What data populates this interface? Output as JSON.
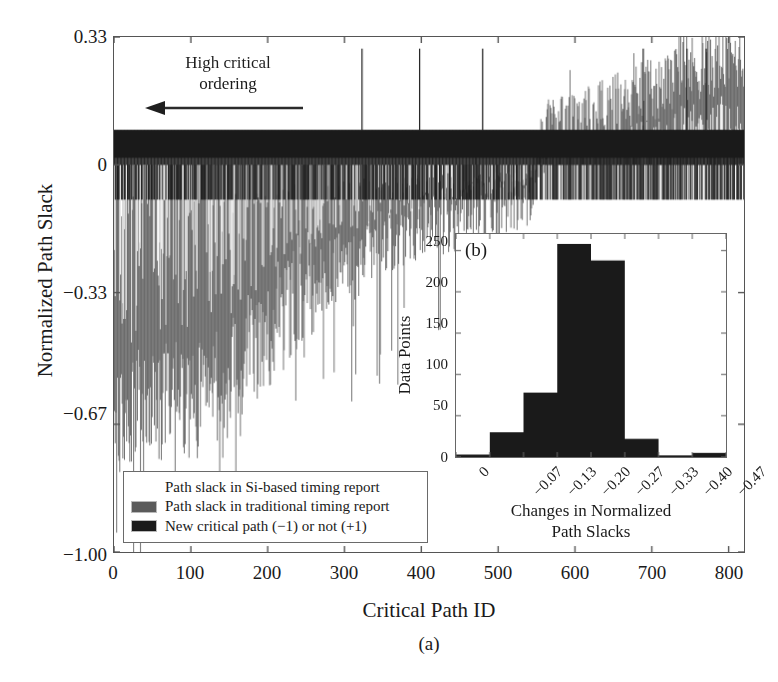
{
  "figure": {
    "panel_a_label": "(a)",
    "panel_b_label": "(b)",
    "annotation": {
      "line1": "High critical",
      "line2": "ordering",
      "arrow_direction": "left"
    }
  },
  "colors": {
    "dark": "#1a1a1a",
    "gray": "#5b5b5b",
    "light": "#ffffff",
    "axis": "#555555",
    "background": "#ffffff"
  },
  "legend": {
    "items": [
      {
        "label": "Path slack in Si-based timing report",
        "color": "#ffffff"
      },
      {
        "label": "Path slack in traditional timing report",
        "color": "#5b5b5b"
      },
      {
        "label": "New critical path (−1) or not (+1)",
        "color": "#1a1a1a"
      }
    ]
  },
  "chart_data": [
    {
      "id": "panel-a",
      "type": "bar",
      "title": "",
      "xlabel": "Critical Path ID",
      "ylabel": "Normalized Path Slack",
      "xlim": [
        0,
        820
      ],
      "ylim": [
        -1.0,
        0.33
      ],
      "grid": false,
      "legend_position": "lower-left",
      "xticks": [
        0,
        100,
        200,
        300,
        400,
        500,
        600,
        700,
        800
      ],
      "xticklabels": [
        "0",
        "100",
        "200",
        "300",
        "400",
        "500",
        "600",
        "700",
        "800"
      ],
      "yticks": [
        0.33,
        0,
        -0.33,
        -0.67,
        -1.0
      ],
      "yticklabels": [
        "0.33",
        "0",
        "−0.33",
        "−0.67",
        "−1.00"
      ],
      "series": [
        {
          "name": "Path slack in traditional timing report",
          "color": "#5b5b5b",
          "note": "Gray envelope: deeply negative at low Path ID, rising toward zero and becoming positive past ~550",
          "x": [
            0,
            20,
            40,
            60,
            80,
            100,
            120,
            140,
            160,
            180,
            200,
            220,
            240,
            260,
            280,
            300,
            320,
            340,
            360,
            380,
            400,
            420,
            440,
            460,
            480,
            500,
            520,
            540,
            560,
            580,
            600,
            620,
            640,
            660,
            680,
            700,
            720,
            740,
            760,
            780,
            800,
            820
          ],
          "values": [
            -0.72,
            -0.7,
            -0.62,
            -0.66,
            -0.6,
            -0.68,
            -0.58,
            -0.62,
            -0.55,
            -0.5,
            -0.46,
            -0.4,
            -0.36,
            -0.32,
            -0.3,
            -0.26,
            -0.28,
            -0.22,
            -0.2,
            -0.19,
            -0.18,
            -0.16,
            -0.15,
            -0.14,
            -0.13,
            -0.12,
            -0.11,
            -0.08,
            0.06,
            0.08,
            0.09,
            0.1,
            0.12,
            0.14,
            0.16,
            0.18,
            0.2,
            0.22,
            0.24,
            0.25,
            0.26,
            0.27
          ]
        },
        {
          "name": "New critical path (−1) or not (+1)",
          "color": "#1a1a1a",
          "note": "Binary indicator band drawn at ±0.09 around zero across the full Path ID range",
          "high_value": 0.09,
          "low_value": -0.09
        }
      ]
    },
    {
      "id": "panel-b",
      "type": "bar",
      "title": "(b)",
      "xlabel": "Changes in Normalized Path Slacks",
      "ylabel": "Data Points",
      "categories": [
        "0",
        "−0.07",
        "−0.13",
        "−0.20",
        "−0.27",
        "−0.33",
        "−0.40",
        "−0.47"
      ],
      "values": [
        3,
        30,
        78,
        258,
        238,
        22,
        2,
        5
      ],
      "xlim": [
        0,
        8
      ],
      "ylim": [
        0,
        270
      ],
      "grid": false,
      "yticks": [
        0,
        50,
        100,
        150,
        200,
        250
      ],
      "yticklabels": [
        "0",
        "50",
        "100",
        "150",
        "200",
        "250"
      ],
      "xticklabels": [
        "0",
        "−0.07",
        "−0.13",
        "−0.20",
        "−0.27",
        "−0.33",
        "−0.40",
        "−0.47"
      ],
      "bar_color": "#1a1a1a"
    }
  ],
  "inset_axis_titles": {
    "xlabel_line1": "Changes in Normalized",
    "xlabel_line2": "Path Slacks",
    "ylabel": "Data Points"
  }
}
